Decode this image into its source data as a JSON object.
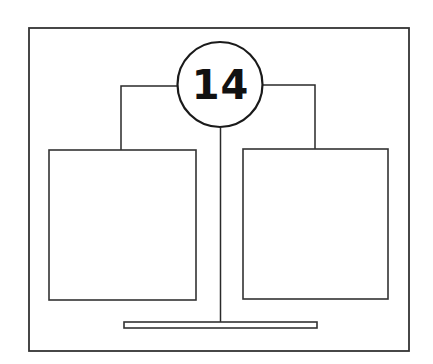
{
  "diagram": {
    "badge": {
      "label": "14"
    },
    "colors": {
      "stroke": "#333333",
      "background": "#ffffff",
      "text": "#111111"
    },
    "elements": [
      {
        "name": "outer-frame",
        "type": "rect"
      },
      {
        "name": "number-badge",
        "type": "circle"
      },
      {
        "name": "left-panel",
        "type": "rect"
      },
      {
        "name": "right-panel",
        "type": "rect"
      },
      {
        "name": "left-connector",
        "type": "line"
      },
      {
        "name": "right-connector",
        "type": "line"
      },
      {
        "name": "center-stem",
        "type": "line"
      },
      {
        "name": "base-bar",
        "type": "rect"
      }
    ]
  }
}
